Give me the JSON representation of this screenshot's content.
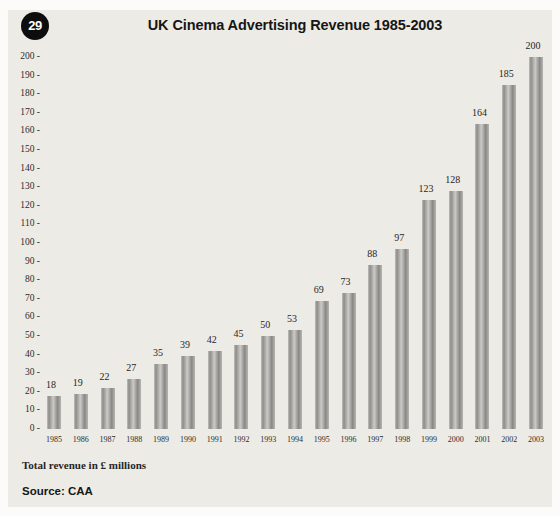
{
  "page": {
    "figure_number": "29",
    "title": "UK Cinema Advertising Revenue 1985-2003",
    "caption": "Total revenue in £ millions",
    "source": "Source: CAA"
  },
  "chart_data": {
    "type": "bar",
    "title": "UK Cinema Advertising Revenue 1985-2003",
    "categories": [
      "1985",
      "1986",
      "1987",
      "1988",
      "1989",
      "1990",
      "1991",
      "1992",
      "1993",
      "1994",
      "1995",
      "1996",
      "1997",
      "1998",
      "1999",
      "2000",
      "2001",
      "2002",
      "2003"
    ],
    "values": [
      18,
      19,
      22,
      27,
      35,
      39,
      42,
      45,
      50,
      53,
      69,
      73,
      88,
      97,
      123,
      128,
      164,
      185,
      200
    ],
    "xlabel": "",
    "ylabel": "Total revenue in £ millions",
    "ylim": [
      0,
      200
    ],
    "ytick_step": 10,
    "ytick_suffix": " -",
    "grid": false,
    "legend": null,
    "source": "CAA",
    "value_labels_shown": true
  },
  "colors": {
    "panel_bg": "#edebe6",
    "outer_bg": "#fcfbf9",
    "bar_mid": "#a3a19e",
    "bar_dark": "#8a8885",
    "bar_light": "#cccac6",
    "badge_bg": "#0d0d0d",
    "badge_text": "#ffffff",
    "text": "#262626"
  }
}
